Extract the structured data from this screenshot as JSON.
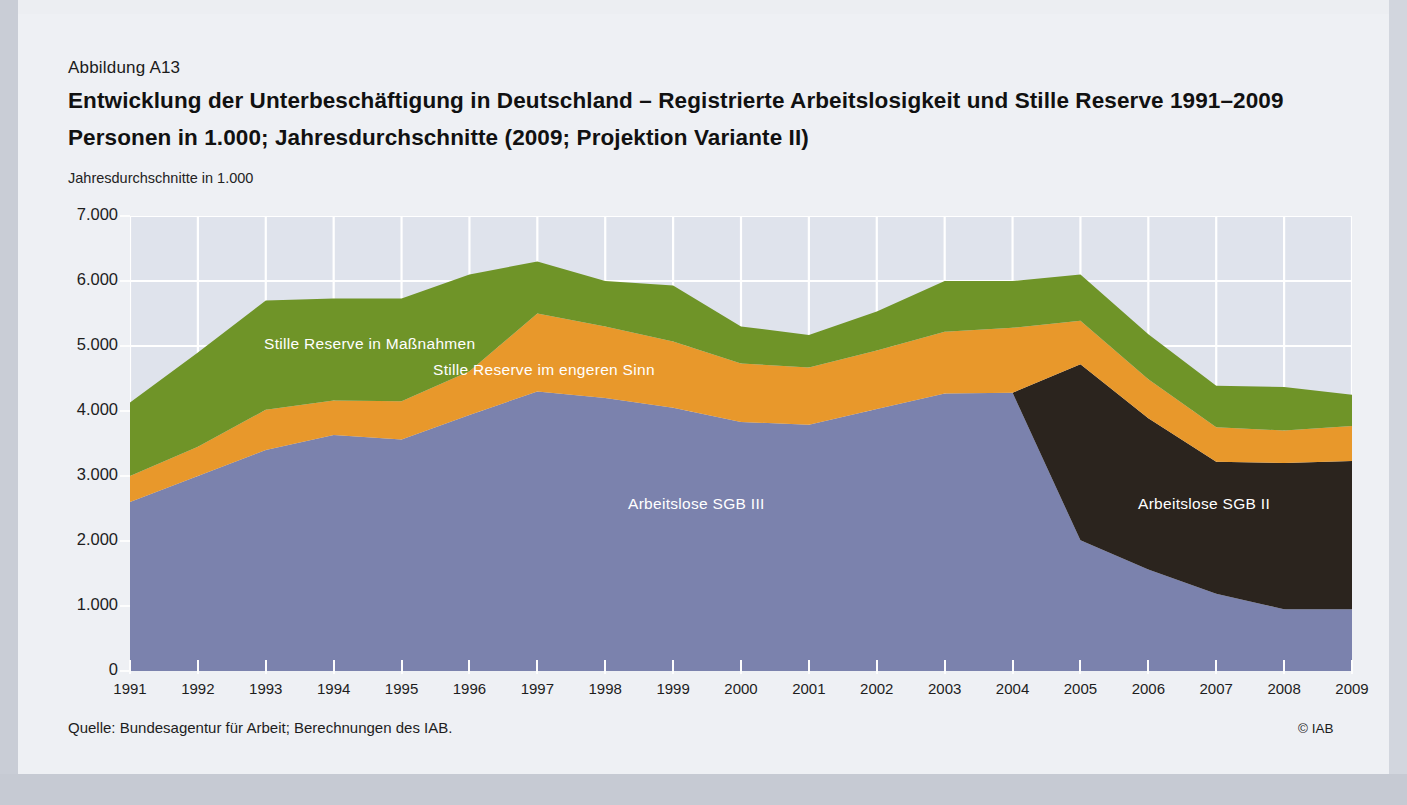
{
  "figure": {
    "number": "Abbildung A13",
    "title_line1": "Entwicklung der Unterbeschäftigung in Deutschland – Registrierte Arbeitslosigkeit und Stille Reserve 1991–2009",
    "title_line2": "Personen in 1.000; Jahresdurchschnitte (2009; Projektion Variante II)",
    "axis_note": "Jahresdurchschnitte in 1.000",
    "source": "Quelle: Bundesagentur für Arbeit; Berechnungen des IAB.",
    "copyright": "© IAB"
  },
  "colors": {
    "plot_background": "#dfe3ec",
    "grid": "#ffffff",
    "sgb3": "#7b82ad",
    "sgb2": "#2b241e",
    "reserve_engeren": "#e8982b",
    "reserve_massnahmen": "#6f9428",
    "page": "#eef0f4",
    "text": "#1d1d1d"
  },
  "chart_data": {
    "type": "area",
    "title": "Entwicklung der Unterbeschäftigung in Deutschland – Registrierte Arbeitslosigkeit und Stille Reserve 1991–2009",
    "subtitle": "Personen in 1.000; Jahresdurchschnitte (2009; Projektion Variante II)",
    "xlabel": "",
    "ylabel": "Jahresdurchschnitte in 1.000",
    "ylim": [
      0,
      7000
    ],
    "ytick_values": [
      0,
      1000,
      2000,
      3000,
      4000,
      5000,
      6000,
      7000
    ],
    "ytick_labels": [
      "0",
      "1.000",
      "2.000",
      "3.000",
      "4.000",
      "5.000",
      "6.000",
      "7.000"
    ],
    "grid": true,
    "legend": "in-plot labels",
    "stacked": true,
    "x": [
      1991,
      1992,
      1993,
      1994,
      1995,
      1996,
      1997,
      1998,
      1999,
      2000,
      2001,
      2002,
      2003,
      2004,
      2005,
      2006,
      2007,
      2008,
      2009
    ],
    "categories": [
      "1991",
      "1992",
      "1993",
      "1994",
      "1995",
      "1996",
      "1997",
      "1998",
      "1999",
      "2000",
      "2001",
      "2002",
      "2003",
      "2004",
      "2005",
      "2006",
      "2007",
      "2008",
      "2009"
    ],
    "series": [
      {
        "name": "Arbeitslose SGB III",
        "color": "#7b82ad",
        "values": [
          2600,
          3000,
          3400,
          3630,
          3560,
          3940,
          4300,
          4200,
          4050,
          3830,
          3790,
          4030,
          4270,
          4280,
          2010,
          1560,
          1190,
          950,
          950
        ]
      },
      {
        "name": "Arbeitslose SGB II",
        "color": "#2b241e",
        "values": [
          0,
          0,
          0,
          0,
          0,
          0,
          0,
          0,
          0,
          0,
          0,
          0,
          0,
          0,
          2710,
          2330,
          2030,
          2250,
          2280
        ]
      },
      {
        "name": "Stille Reserve im engeren Sinn",
        "color": "#e8982b",
        "values": [
          400,
          450,
          620,
          530,
          590,
          670,
          1200,
          1100,
          1020,
          900,
          880,
          900,
          950,
          1000,
          670,
          600,
          530,
          500,
          540
        ]
      },
      {
        "name": "Stille Reserve in Maßnahmen",
        "color": "#6f9428",
        "values": [
          1130,
          1450,
          1680,
          1570,
          1580,
          1490,
          800,
          700,
          860,
          570,
          500,
          600,
          780,
          720,
          710,
          690,
          640,
          670,
          480
        ]
      }
    ],
    "annotations": [
      {
        "text": "Stille Reserve in Maßnahmen",
        "series": "Stille Reserve in Maßnahmen"
      },
      {
        "text": "Stille Reserve im engeren Sinn",
        "series": "Stille Reserve im engeren Sinn"
      },
      {
        "text": "Arbeitslose SGB III",
        "series": "Arbeitslose SGB III"
      },
      {
        "text": "Arbeitslose SGB II",
        "series": "Arbeitslose SGB II"
      }
    ],
    "totals": [
      4130,
      4900,
      5700,
      5730,
      5730,
      6100,
      6300,
      6000,
      5930,
      5300,
      5170,
      5530,
      6000,
      6000,
      6100,
      5180,
      4390,
      4370,
      4250
    ]
  }
}
